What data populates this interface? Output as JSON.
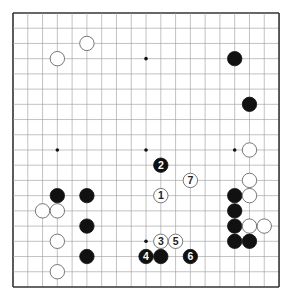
{
  "board": {
    "size": 19,
    "origin": {
      "x": 13,
      "y": 13
    },
    "spacing": {
      "x": 14.78,
      "y": 15.22
    },
    "stone_radius": 7.2,
    "colors": {
      "line": "#9a9a9a",
      "edge": "#333333",
      "black": "#111111",
      "white": "#ffffff",
      "white_stroke": "#555555"
    },
    "star_points": [
      [
        3,
        3
      ],
      [
        9,
        3
      ],
      [
        15,
        3
      ],
      [
        3,
        9
      ],
      [
        9,
        9
      ],
      [
        15,
        9
      ],
      [
        3,
        15
      ],
      [
        9,
        15
      ],
      [
        15,
        15
      ]
    ],
    "stones": [
      {
        "col": 3,
        "row": 3,
        "color": "white",
        "label": ""
      },
      {
        "col": 5,
        "row": 2,
        "color": "white",
        "label": ""
      },
      {
        "col": 15,
        "row": 3,
        "color": "black",
        "label": ""
      },
      {
        "col": 16,
        "row": 6,
        "color": "black",
        "label": ""
      },
      {
        "col": 16,
        "row": 9,
        "color": "white",
        "label": ""
      },
      {
        "col": 16,
        "row": 11,
        "color": "white",
        "label": ""
      },
      {
        "col": 15,
        "row": 12,
        "color": "black",
        "label": ""
      },
      {
        "col": 16,
        "row": 12,
        "color": "white",
        "label": ""
      },
      {
        "col": 15,
        "row": 13,
        "color": "black",
        "label": ""
      },
      {
        "col": 15,
        "row": 14,
        "color": "black",
        "label": ""
      },
      {
        "col": 16,
        "row": 14,
        "color": "white",
        "label": ""
      },
      {
        "col": 17,
        "row": 14,
        "color": "white",
        "label": ""
      },
      {
        "col": 15,
        "row": 15,
        "color": "black",
        "label": ""
      },
      {
        "col": 16,
        "row": 15,
        "color": "black",
        "label": ""
      },
      {
        "col": 3,
        "row": 12,
        "color": "black",
        "label": ""
      },
      {
        "col": 5,
        "row": 12,
        "color": "black",
        "label": ""
      },
      {
        "col": 2,
        "row": 13,
        "color": "white",
        "label": ""
      },
      {
        "col": 3,
        "row": 13,
        "color": "white",
        "label": ""
      },
      {
        "col": 5,
        "row": 14,
        "color": "black",
        "label": ""
      },
      {
        "col": 3,
        "row": 15,
        "color": "white",
        "label": ""
      },
      {
        "col": 5,
        "row": 16,
        "color": "black",
        "label": ""
      },
      {
        "col": 3,
        "row": 17,
        "color": "white",
        "label": ""
      },
      {
        "col": 10,
        "row": 12,
        "color": "white",
        "label": "1"
      },
      {
        "col": 10,
        "row": 10,
        "color": "black",
        "label": "2"
      },
      {
        "col": 10,
        "row": 15,
        "color": "white",
        "label": "3"
      },
      {
        "col": 9,
        "row": 16,
        "color": "black",
        "label": "4"
      },
      {
        "col": 11,
        "row": 15,
        "color": "white",
        "label": "5"
      },
      {
        "col": 12,
        "row": 16,
        "color": "black",
        "label": "6"
      },
      {
        "col": 12,
        "row": 11,
        "color": "white",
        "label": "7"
      },
      {
        "col": 10,
        "row": 16,
        "color": "black",
        "label": ""
      }
    ]
  }
}
